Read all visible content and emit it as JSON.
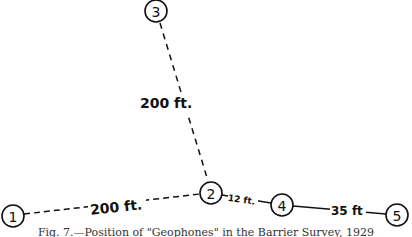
{
  "diagram": {
    "nodes": [
      {
        "id": "1",
        "label": "1",
        "x": 13,
        "y": 216
      },
      {
        "id": "2",
        "label": "2",
        "x": 211,
        "y": 193
      },
      {
        "id": "3",
        "label": "3",
        "x": 156,
        "y": 11
      },
      {
        "id": "4",
        "label": "4",
        "x": 282,
        "y": 205
      },
      {
        "id": "5",
        "label": "5",
        "x": 397,
        "y": 215
      }
    ],
    "edges": [
      {
        "from": "1",
        "to": "2",
        "style": "dashed",
        "label": "200 ft."
      },
      {
        "from": "3",
        "to": "2",
        "style": "dashed",
        "label": "200 ft."
      },
      {
        "from": "2",
        "to": "4",
        "style": "solid",
        "label": "12 ft."
      },
      {
        "from": "4",
        "to": "5",
        "style": "solid",
        "label": "35 ft"
      }
    ],
    "caption": "Fig. 7.—Position of \"Geophones\" in the Barrier Survey, 1929"
  }
}
